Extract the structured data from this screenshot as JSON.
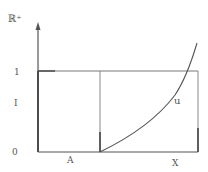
{
  "diagram": {
    "axis_label": "ℝ⁺",
    "y_ticks": [
      {
        "label": "1"
      },
      {
        "label": "I"
      },
      {
        "label": "0"
      }
    ],
    "x_labels": {
      "left_segment": "A",
      "right_end": "X"
    },
    "curve_label": "u",
    "colors": {
      "line": "#555555",
      "background": "#ffffff"
    }
  }
}
